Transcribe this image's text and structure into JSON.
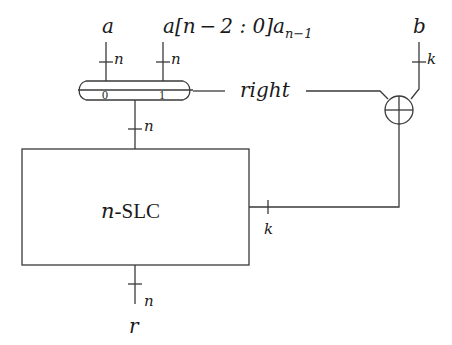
{
  "diagram": {
    "inputs": {
      "a": {
        "label": "a",
        "width": "n"
      },
      "a_rot": {
        "label_main": "a[n − 2 : 0]a",
        "label_sub": "n−1",
        "width": "n"
      },
      "b": {
        "label": "b",
        "width": "k"
      }
    },
    "mux": {
      "port0": "0",
      "port1": "1",
      "select_label": "right",
      "output_width": "n"
    },
    "block": {
      "label_italic": "n",
      "label_rest": "-SLC",
      "side_width": "k"
    },
    "output": {
      "label": "r",
      "width": "n"
    },
    "xor": {
      "symbol": "xor-gate"
    },
    "colors": {
      "line": "#3a3a3a",
      "text": "#1a1a1a",
      "background": "#ffffff"
    }
  }
}
